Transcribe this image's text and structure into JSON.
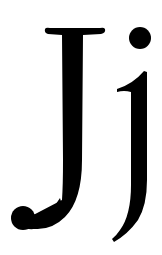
{
  "glyphs": {
    "text": "Jj",
    "uppercase": "J",
    "lowercase": "j",
    "color": "#000000",
    "background": "#ffffff"
  }
}
